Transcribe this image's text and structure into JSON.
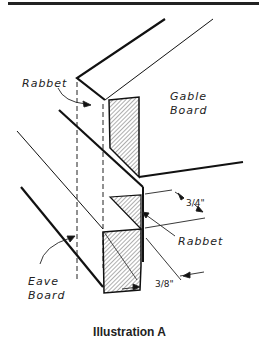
{
  "illustration": {
    "caption": "Illustration A",
    "labels": {
      "rabbet_top": "Rabbet",
      "gable_board_line1": "Gable",
      "gable_board_line2": "Board",
      "rabbet_right": "Rabbet",
      "eave_board_line1": "Eave",
      "eave_board_line2": "Board"
    },
    "dimensions": {
      "three_quarter": "3/4\"",
      "three_eighths": "3/8\""
    }
  }
}
